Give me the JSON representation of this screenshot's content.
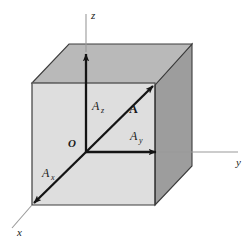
{
  "figure": {
    "background_color": "#ffffff",
    "axes": {
      "x_label": "x",
      "y_label": "y",
      "z_label": "z",
      "axis_color": "#141414",
      "guide_color": "#9a9a9a"
    },
    "origin": {
      "label": "O"
    },
    "vector": {
      "label": "A",
      "color": "#141414"
    },
    "components": {
      "x_label": "A",
      "x_sub": "x",
      "y_label": "A",
      "y_sub": "y",
      "z_label": "A",
      "z_sub": "z"
    },
    "cube": {
      "front_face_color": "#dedede",
      "top_face_color": "#b9b9b9",
      "right_face_color": "#9d9d9d",
      "edge_color": "#3c3c3c",
      "inner_line_color": "#6e6e6e"
    }
  }
}
